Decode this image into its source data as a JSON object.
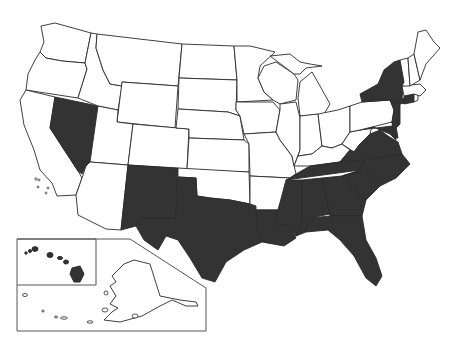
{
  "map": {
    "title": "United States map with highlighted states",
    "colors": {
      "highlighted": "#333333",
      "default": "#ffffff",
      "border": "#2a2a2a"
    },
    "highlighted_states": [
      "Nevada",
      "New Mexico",
      "Texas",
      "Louisiana",
      "Mississippi",
      "Alabama",
      "Tennessee",
      "Georgia",
      "Florida",
      "South Carolina",
      "North Carolina",
      "Virginia",
      "Maryland",
      "Delaware",
      "New Jersey",
      "New York",
      "Connecticut",
      "Hawaii"
    ],
    "unhighlighted_states": [
      "Washington",
      "Oregon",
      "California",
      "Idaho",
      "Montana",
      "Wyoming",
      "Utah",
      "Arizona",
      "Colorado",
      "North Dakota",
      "South Dakota",
      "Nebraska",
      "Kansas",
      "Oklahoma",
      "Minnesota",
      "Iowa",
      "Missouri",
      "Arkansas",
      "Wisconsin",
      "Illinois",
      "Michigan",
      "Indiana",
      "Ohio",
      "Kentucky",
      "West Virginia",
      "Pennsylvania",
      "Vermont",
      "New Hampshire",
      "Maine",
      "Massachusetts",
      "Rhode Island",
      "Alaska"
    ],
    "insets": [
      "Alaska",
      "Hawaii"
    ]
  }
}
